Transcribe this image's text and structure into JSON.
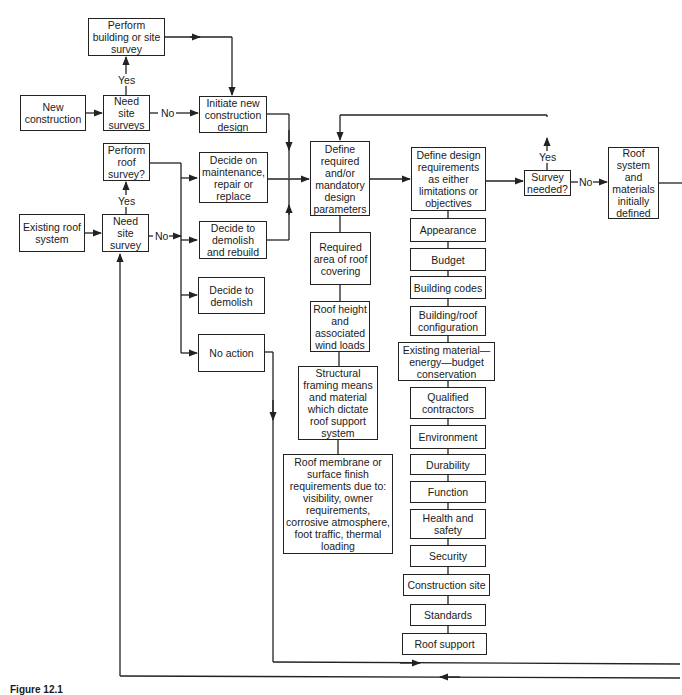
{
  "diagram": {
    "type": "flowchart",
    "caption": "Figure 12.1",
    "nodes": {
      "perform_building_survey": "Perform building or site survey",
      "new_construction": "New construction",
      "need_site_surveys": "Need site surveys",
      "initiate_new_design": "Initiate new construction design",
      "perform_roof_survey": "Perform roof survey?",
      "decide_maintenance": "Decide on maintenance, repair or replace",
      "existing_roof_system": "Existing roof system",
      "need_site_survey": "Need site survey",
      "decide_demolish_rebuild": "Decide to demolish and rebuild",
      "decide_demolish": "Decide to demolish",
      "no_action": "No action",
      "define_parameters": "Define required and/or mandatory design parameters",
      "required_area": "Required area of roof covering",
      "roof_height": "Roof height and associated wind loads",
      "structural_framing": "Structural framing means and material which dictate roof support system",
      "roof_membrane": "Roof membrane or surface finish requirements due to: visibility, owner requirements, corrosive atmosphere, foot traffic, thermal loading",
      "define_requirements": "Define design requirements as either limitations or objectives",
      "survey_needed": "Survey needed?",
      "roof_system_defined": "Roof system and materials initially defined"
    },
    "requirements_list": [
      "Appearance",
      "Budget",
      "Building codes",
      "Building/roof configuration",
      "Existing material—energy—budget conservation",
      "Qualified contractors",
      "Environment",
      "Durability",
      "Function",
      "Health and safety",
      "Security",
      "Construction site",
      "Standards",
      "Roof support"
    ],
    "edge_labels": {
      "yes1": "Yes",
      "no1": "No",
      "yes2": "Yes",
      "no2": "No",
      "yes3": "Yes",
      "no3": "No"
    }
  }
}
